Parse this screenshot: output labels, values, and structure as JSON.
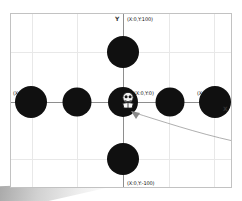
{
  "canvas": {
    "width": 242,
    "height": 201,
    "background": "#ffffff",
    "shadow_color": "#9a9a9a"
  },
  "plot": {
    "frame_border_color": "#c2c2c2",
    "grid_color": "#e8e8e8",
    "axis_color": "#8e8e8e",
    "marker_color": "#101010",
    "label_color": "#111111",
    "leader_color": "#9b9b9b",
    "x_axis_letter": "X",
    "y_axis_letter": "Y"
  },
  "axis_labels": [
    {
      "id": "top",
      "text": "(X:0,Y:100)",
      "x": 126,
      "y": 15
    },
    {
      "id": "bottom",
      "text": "(X:0,Y:-100)",
      "x": 126,
      "y": 179
    },
    {
      "id": "left",
      "text": "(X:-100,Y:0)",
      "x": 12,
      "y": 89
    },
    {
      "id": "right",
      "text": "(X:100,Y:0)",
      "x": 196,
      "y": 89
    },
    {
      "id": "origin",
      "text": "(X:0,Y:0)",
      "x": 133,
      "y": 89
    }
  ],
  "markers": [
    {
      "id": "marker-y-positive",
      "cx": 122,
      "cy": 51,
      "r": 16,
      "coord": "(X:0,Y:100)"
    },
    {
      "id": "marker-y-negative",
      "cx": 122,
      "cy": 158,
      "r": 16,
      "coord": "(X:0,Y:-100)"
    },
    {
      "id": "marker-x-negative-far",
      "cx": 30,
      "cy": 101,
      "r": 16,
      "coord": "(X:-100,Y:0)"
    },
    {
      "id": "marker-x-negative-mid",
      "cx": 76,
      "cy": 101,
      "r": 14,
      "coord": "(X:-50,Y:0)"
    },
    {
      "id": "marker-origin",
      "cx": 122,
      "cy": 101,
      "r": 15,
      "coord": "(X:0,Y:0)"
    },
    {
      "id": "marker-x-positive-mid",
      "cx": 169,
      "cy": 101,
      "r": 14,
      "coord": "(X:50,Y:0)"
    },
    {
      "id": "marker-x-positive-far",
      "cx": 214,
      "cy": 101,
      "r": 16,
      "coord": "(X:100,Y:0)"
    }
  ],
  "gridlines": {
    "vertical_x": [
      31,
      76,
      168,
      213
    ],
    "horizontal_y": [
      51,
      157
    ]
  },
  "axes": {
    "y_axis_x": 122,
    "x_axis_y": 101
  },
  "annotation": {
    "id": "origin-callout",
    "target_x": 130,
    "target_y": 110,
    "path": "M 131 111 C 160 120, 196 132, 232 140",
    "arrow_points": "131,111 140,112 136,119",
    "description": "curved leader line pointing at origin cursor"
  },
  "cursor": {
    "id": "origin-cursor",
    "x": 126,
    "y": 98,
    "label": "pointer-sprite"
  }
}
